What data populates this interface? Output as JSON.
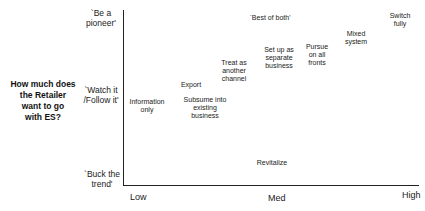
{
  "diagram": {
    "y_axis_question": [
      "How much does",
      "the Retailer",
      "want to go",
      "with ES?"
    ],
    "y_levels": [
      {
        "lines": [
          "`Be a",
          "pioneer'"
        ]
      },
      {
        "lines": [
          "`Watch it",
          "/Follow it'"
        ]
      },
      {
        "lines": [
          "`Buck the",
          "trend'"
        ]
      }
    ],
    "x_levels": [
      "Low",
      "Med",
      "High"
    ],
    "annotation": "`Best of both'",
    "strategies": [
      {
        "lines": [
          "Information",
          "only"
        ]
      },
      {
        "lines": [
          "Export"
        ]
      },
      {
        "lines": [
          "Subsume into",
          "existing",
          "business"
        ]
      },
      {
        "lines": [
          "Treat as",
          "another",
          "channel"
        ]
      },
      {
        "lines": [
          "Set up as",
          "separate",
          "business"
        ]
      },
      {
        "lines": [
          "Pursue",
          "on all",
          "fronts"
        ]
      },
      {
        "lines": [
          "Mixed",
          "system"
        ]
      },
      {
        "lines": [
          "Switch",
          "fully"
        ]
      },
      {
        "lines": [
          "Revitalize"
        ]
      }
    ]
  }
}
